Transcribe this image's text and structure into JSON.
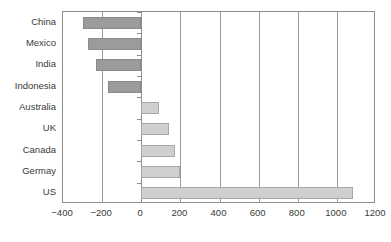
{
  "chart_data": {
    "type": "bar",
    "orientation": "horizontal",
    "title": "",
    "subtitle": "",
    "xlabel": "",
    "ylabel": "",
    "categories": [
      "China",
      "Mexico",
      "India",
      "Indonesia",
      "Australia",
      "UK",
      "Germay",
      "Canada",
      "US"
    ],
    "display_order": [
      "China",
      "Mexico",
      "India",
      "Indonesia",
      "Australia",
      "UK",
      "Canada",
      "Germay",
      "US"
    ],
    "values": [
      -298,
      -273,
      -229,
      -170,
      93,
      145,
      200,
      172,
      1083
    ],
    "series": [
      {
        "name": "Trade balance",
        "categories": [
          "China",
          "Mexico",
          "India",
          "Indonesia",
          "Australia",
          "UK",
          "Canada",
          "Germay",
          "US"
        ],
        "values": [
          -298,
          -273,
          -229,
          -170,
          93,
          145,
          172,
          200,
          1083
        ]
      }
    ],
    "xlim": [
      -400,
      1200
    ],
    "xticks": [
      -400,
      -200,
      0,
      200,
      400,
      600,
      800,
      1000,
      1200
    ],
    "xtick_labels": [
      "−400",
      "−200",
      "0",
      "200",
      "400",
      "600",
      "800",
      "1000",
      "1200"
    ],
    "grid": true,
    "grid_axis": "x",
    "legend": false,
    "legend_position": "none",
    "colors": {
      "negative_bar": "#9b9b9b",
      "positive_bar": "#cfcfcf",
      "bar_border": "#9b9b9b",
      "gridline": "#9a9a9a",
      "axis": "#8d8d8d",
      "text": "#3a3a3a",
      "background": "#ffffff"
    }
  }
}
